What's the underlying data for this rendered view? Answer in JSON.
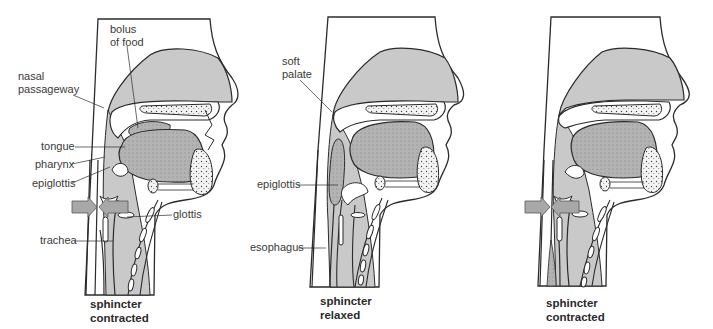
{
  "colors": {
    "outline": "#2b2b2b",
    "tissue_fill": "#c9c9c9",
    "tongue_fill": "#b3b3b3",
    "bolus_fill": "#a6a6a6",
    "arrow_fill": "#a8a8a8",
    "background": "#ffffff"
  },
  "panels": [
    {
      "id": "left",
      "caption": [
        "sphincter",
        "contracted"
      ],
      "labels": {
        "bolus": [
          "bolus",
          "of food"
        ],
        "nasal": [
          "nasal",
          "passageway"
        ],
        "tongue": "tongue",
        "pharynx": "pharynx",
        "epiglottis": "epiglottis",
        "glottis": "glottis",
        "trachea": "trachea"
      },
      "arrows": "sphincter-arrows-inward"
    },
    {
      "id": "middle",
      "caption": [
        "sphincter",
        "relaxed"
      ],
      "labels": {
        "soft_palate": [
          "soft",
          "palate"
        ],
        "epiglottis": "epiglottis",
        "esophagus": "esophagus"
      }
    },
    {
      "id": "right",
      "caption": [
        "sphincter",
        "contracted"
      ],
      "arrows": "sphincter-arrows-inward"
    }
  ]
}
